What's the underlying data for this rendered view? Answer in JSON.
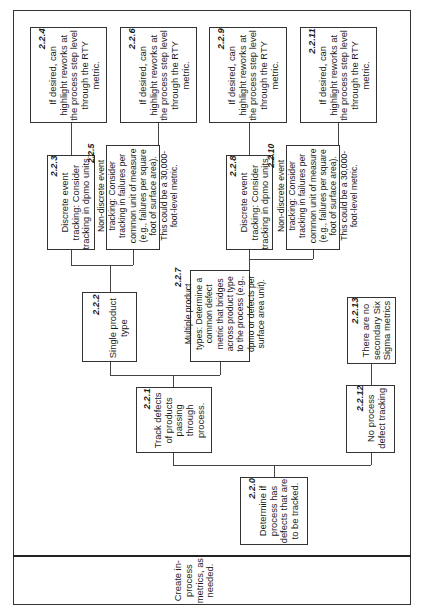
{
  "diagram": {
    "orientation": "rotated -90 degrees (text reads bottom to top)",
    "row_label": "Create in-process metrics, as needed.",
    "nodes": [
      {
        "id": "2.2.0",
        "text": "Determine if process has defects that are to be tracked."
      },
      {
        "id": "2.2.1",
        "text": "Track defects of products passing through process."
      },
      {
        "id": "2.2.2",
        "text": "Single product type"
      },
      {
        "id": "2.2.3",
        "text": "Discrete event tracking: Consider tracking in dpmo units."
      },
      {
        "id": "2.2.4",
        "text": "If desired, can highlight reworks at the process step level through the RTY metric."
      },
      {
        "id": "2.2.5",
        "text": "Non-discrete event tracking: Consider tracking in failures per common unit of measure (e.g., failures per square foot of surface area). This could be a 30,000-foot-level metric."
      },
      {
        "id": "2.2.6",
        "text": "If desired, can highlight reworks at the process step level through the RTY metric."
      },
      {
        "id": "2.2.7",
        "text": "Multiple product types: Determine a common defect metric that bridges across product type to the process (e.g., dpmo or defects per surface area unit)."
      },
      {
        "id": "2.2.8",
        "text": "Discrete event tracking: Consider tracking in dpmo units."
      },
      {
        "id": "2.2.9",
        "text": "If desired, can highlight reworks at the process step level through the RTY metric."
      },
      {
        "id": "2.2.10",
        "text": "Non-discrete event tracking: Consider tracking in failures per common unit of measure (e.g., failures per square foot of surface area). This could be a 30,000-foot-level metric."
      },
      {
        "id": "2.2.11",
        "text": "If desired, can highlight reworks at the process step level through the RTY metric."
      },
      {
        "id": "2.2.12",
        "text": "No process defect tracking"
      },
      {
        "id": "2.2.13",
        "text": "There are no secondary Six Sigma metrics"
      }
    ],
    "edges": [
      [
        "2.2.0",
        "2.2.1"
      ],
      [
        "2.2.0",
        "2.2.12"
      ],
      [
        "2.2.1",
        "2.2.2"
      ],
      [
        "2.2.1",
        "2.2.7"
      ],
      [
        "2.2.2",
        "2.2.3"
      ],
      [
        "2.2.2",
        "2.2.5"
      ],
      [
        "2.2.3",
        "2.2.4"
      ],
      [
        "2.2.5",
        "2.2.6"
      ],
      [
        "2.2.7",
        "2.2.8"
      ],
      [
        "2.2.7",
        "2.2.10"
      ],
      [
        "2.2.8",
        "2.2.9"
      ],
      [
        "2.2.10",
        "2.2.11"
      ],
      [
        "2.2.12",
        "2.2.13"
      ]
    ],
    "n0": {
      "id": "2.2.0",
      "l1": "Determine if",
      "l2": "process has",
      "l3": "defects that are",
      "l4": "to be tracked."
    },
    "n1": {
      "id": "2.2.1",
      "l1": "Track defects",
      "l2": "of products",
      "l3": "passing",
      "l4": "through",
      "l5": "process."
    },
    "n2": {
      "id": "2.2.2",
      "l1": "Single product",
      "l2": "type"
    },
    "n3": {
      "id": "2.2.3",
      "l1": "Discrete event",
      "l2": "tracking: Consider",
      "l3": "tracking in dpmo units."
    },
    "n4": {
      "id": "2.2.4",
      "l1": "If desired, can",
      "l2": "highlight reworks at",
      "l3": "the process step level",
      "l4": "through the RTY",
      "l5": "metric."
    },
    "n5": {
      "id": "2.2.5",
      "l1": "Non-discrete event",
      "l2": "tracking: Consider",
      "l3": "tracking in failures per",
      "l4": "common unit of measure",
      "l5": "(e.g., failures per square",
      "l6": "foot of surface area).",
      "l7": "This could be a 30,000-",
      "l8": "foot-level metric."
    },
    "n6": {
      "id": "2.2.6",
      "l1": "If desired, can",
      "l2": "highlight reworks at",
      "l3": "the process step level",
      "l4": "through the RTY",
      "l5": "metric."
    },
    "n7": {
      "id": "2.2.7",
      "l1": "Multiple product",
      "l2": "types: Determine a",
      "l3": "common defect",
      "l4": "metric that bridges",
      "l5": "across product type",
      "l6": "to the process (e.g.,",
      "l7": "dpmo or defects per",
      "l8": "surface area unit)."
    },
    "n8": {
      "id": "2.2.8",
      "l1": "Discrete event",
      "l2": "tracking: Consider",
      "l3": "tracking in dpmo units."
    },
    "n9": {
      "id": "2.2.9",
      "l1": "If desired, can",
      "l2": "highlight reworks at",
      "l3": "the process step level",
      "l4": "through the RTY",
      "l5": "metric."
    },
    "n10": {
      "id": "2.2.10",
      "l1": "Non-discrete event",
      "l2": "tracking: Consider",
      "l3": "tracking in failures per",
      "l4": "common unit of measure",
      "l5": "(e.g., failures per square",
      "l6": "foot of surface area).",
      "l7": "This could be a 30,000-",
      "l8": "foot-level metric."
    },
    "n11": {
      "id": "2.2.11",
      "l1": "If desired, can",
      "l2": "highlight reworks at",
      "l3": "the process step level",
      "l4": "through the RTY",
      "l5": "metric."
    },
    "n12": {
      "id": "2.2.12",
      "l1": "No process",
      "l2": "defect tracking"
    },
    "n13": {
      "id": "2.2.13",
      "l1": "There are no",
      "l2": "secondary Six",
      "l3": "Sigma metrics"
    },
    "label": {
      "l1": "Create in-",
      "l2": "process",
      "l3": "metrics, as",
      "l4": "needed."
    }
  }
}
